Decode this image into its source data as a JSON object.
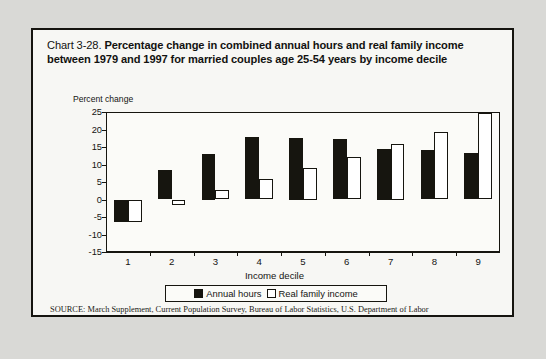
{
  "card": {
    "title_prefix": "Chart 3-28. ",
    "title_bold": "Percentage change in combined annual hours and real family income between 1979 and 1997 for married couples age 25-54 years by income decile",
    "source": "SOURCE: March Supplement, Current Population Survey, Bureau of Labor Statistics, U.S. Department of Labor"
  },
  "chart_data": {
    "type": "bar",
    "title": "Chart 3-28. Percentage change in combined annual hours and real family income between 1979 and 1997 for married couples age 25-54 years by income decile",
    "xlabel": "Income decile",
    "ylabel": "Percent change",
    "categories": [
      "1",
      "2",
      "3",
      "4",
      "5",
      "6",
      "7",
      "8",
      "9"
    ],
    "series": [
      {
        "name": "Annual hours",
        "color": "#16150f",
        "values": [
          -6.5,
          8.3,
          13.0,
          17.8,
          17.5,
          17.4,
          14.5,
          14.2,
          13.2
        ]
      },
      {
        "name": "Real family income",
        "color": "#ffffff",
        "values": [
          -6.5,
          -1.7,
          2.8,
          5.9,
          9.0,
          12.2,
          16.0,
          19.4,
          24.6
        ]
      }
    ],
    "ylim": [
      -15,
      25
    ],
    "yticks": [
      25,
      20,
      15,
      10,
      5,
      0,
      -5,
      -10,
      -15
    ],
    "grid": false,
    "legend_position": "bottom"
  }
}
